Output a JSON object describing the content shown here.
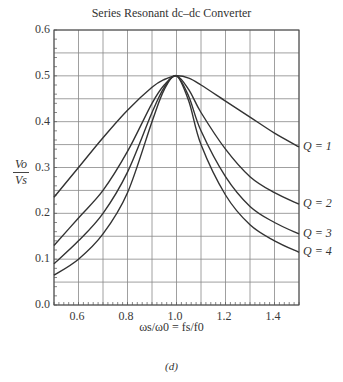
{
  "chart_data": {
    "type": "line",
    "title": "Series Resonant dc–dc Converter",
    "xlabel": "ωs/ω0 = fs/f0",
    "ylabel": "Vo/Vs",
    "caption": "(d)",
    "xlim": [
      0.5,
      1.5
    ],
    "ylim": [
      0.0,
      0.6
    ],
    "grid": true,
    "x_ticks": [
      "0.6",
      "0.8",
      "1.0",
      "1.2",
      "1.4"
    ],
    "y_ticks": [
      "0.0",
      "0.1",
      "0.2",
      "0.3",
      "0.4",
      "0.5",
      "0.6"
    ],
    "x": [
      0.5,
      0.6,
      0.7,
      0.8,
      0.9,
      0.95,
      1.0,
      1.05,
      1.1,
      1.2,
      1.3,
      1.4,
      1.5
    ],
    "series": [
      {
        "name": "Q = 1",
        "values": [
          0.235,
          0.3,
          0.365,
          0.425,
          0.475,
          0.492,
          0.5,
          0.495,
          0.48,
          0.445,
          0.41,
          0.375,
          0.345
        ]
      },
      {
        "name": "Q = 2",
        "values": [
          0.13,
          0.19,
          0.25,
          0.335,
          0.44,
          0.48,
          0.5,
          0.47,
          0.42,
          0.34,
          0.28,
          0.245,
          0.22
        ]
      },
      {
        "name": "Q = 3",
        "values": [
          0.09,
          0.14,
          0.2,
          0.29,
          0.42,
          0.475,
          0.5,
          0.455,
          0.38,
          0.28,
          0.215,
          0.18,
          0.155
        ]
      },
      {
        "name": "Q = 4",
        "values": [
          0.065,
          0.1,
          0.155,
          0.245,
          0.4,
          0.47,
          0.5,
          0.445,
          0.35,
          0.24,
          0.175,
          0.14,
          0.115
        ]
      }
    ]
  },
  "labels": {
    "title": "Series Resonant dc–dc Converter",
    "y_num": "Vo",
    "y_den": "Vs",
    "x_label": "ωs/ω0 = fs/f0",
    "caption": "(d)"
  }
}
